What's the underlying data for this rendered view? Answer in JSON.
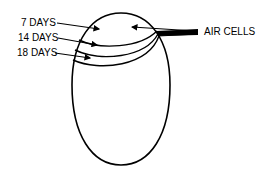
{
  "diagram": {
    "labels": {
      "day7": "7 DAYS",
      "day14": "14 DAYS",
      "day18": "18 DAYS",
      "air_cells": "AIR CELLS"
    },
    "colors": {
      "stroke": "#000000",
      "background": "#ffffff"
    }
  }
}
